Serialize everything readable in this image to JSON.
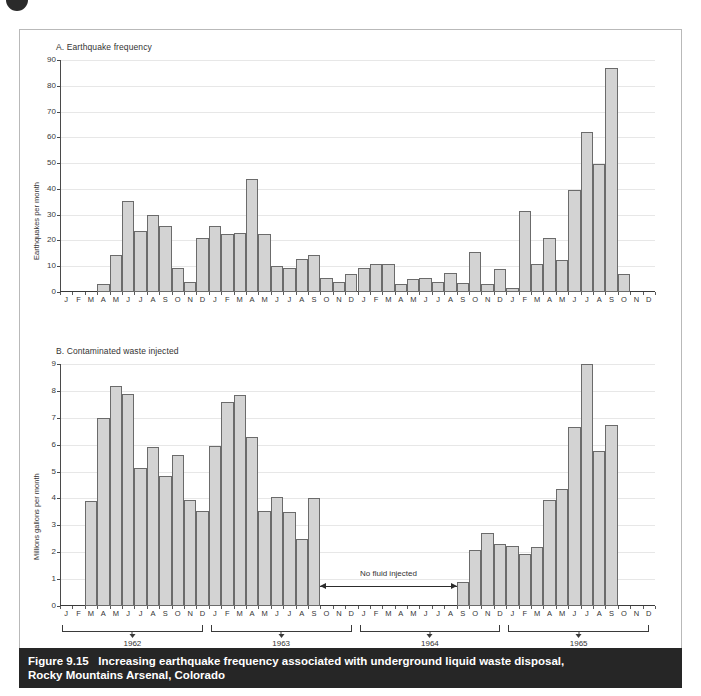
{
  "figure": {
    "caption_number": "Figure 9.15",
    "caption_line1": "Increasing earthquake frequency associated with underground liquid waste disposal,",
    "caption_line2": "Rocky Mountains Arsenal, Colorado",
    "accent_bar_color": "#262626",
    "bar_fill_color": "#d3d3d3",
    "bar_stroke_color": "#6b6b6b",
    "gridline_color": "#e7e7e7"
  },
  "months": [
    "J",
    "F",
    "M",
    "A",
    "M",
    "J",
    "J",
    "A",
    "S",
    "O",
    "N",
    "D"
  ],
  "years": [
    "1962",
    "1963",
    "1964",
    "1965"
  ],
  "annotation": {
    "no_fluid": "No fluid injected"
  },
  "chart_data": [
    {
      "type": "bar",
      "id": "A",
      "title": "A. Earthquake frequency",
      "ylabel": "Earthquakes per month",
      "xlabel": "",
      "ylim": [
        0,
        90
      ],
      "yticks": [
        0,
        10,
        20,
        30,
        40,
        50,
        60,
        70,
        80,
        90
      ],
      "grid": true,
      "legend": "none",
      "categories": [
        "1962-J",
        "1962-F",
        "1962-M",
        "1962-A",
        "1962-M",
        "1962-J",
        "1962-J",
        "1962-A",
        "1962-S",
        "1962-O",
        "1962-N",
        "1962-D",
        "1963-J",
        "1963-F",
        "1963-M",
        "1963-A",
        "1963-M",
        "1963-J",
        "1963-J",
        "1963-A",
        "1963-S",
        "1963-O",
        "1963-N",
        "1963-D",
        "1964-J",
        "1964-F",
        "1964-M",
        "1964-A",
        "1964-M",
        "1964-J",
        "1964-J",
        "1964-A",
        "1964-S",
        "1964-O",
        "1964-N",
        "1964-D",
        "1965-J",
        "1965-F",
        "1965-M",
        "1965-A",
        "1965-M",
        "1965-J",
        "1965-J",
        "1965-A",
        "1965-S",
        "1965-O",
        "1965-N",
        "1965-D"
      ],
      "values": [
        0,
        0,
        0,
        3,
        14.5,
        35.5,
        23.5,
        30,
        25.5,
        9.5,
        4,
        21,
        25.5,
        22.5,
        23,
        44,
        22.5,
        10,
        9.5,
        13,
        14.5,
        5.5,
        4,
        7,
        9.5,
        11,
        11,
        3,
        5,
        5.5,
        4,
        7.5,
        3.5,
        15.5,
        3,
        9,
        1.5,
        31.5,
        11,
        21,
        12.5,
        39.5,
        62,
        49.5,
        87,
        7,
        0,
        0
      ]
    },
    {
      "type": "bar",
      "id": "B",
      "title": "B. Contaminated waste injected",
      "ylabel": "Millions gallons per month",
      "xlabel": "",
      "ylim": [
        0,
        9
      ],
      "yticks": [
        0,
        1,
        2,
        3,
        4,
        5,
        6,
        7,
        8,
        9
      ],
      "grid": true,
      "legend": "none",
      "categories": [
        "1962-J",
        "1962-F",
        "1962-M",
        "1962-A",
        "1962-M",
        "1962-J",
        "1962-J",
        "1962-A",
        "1962-S",
        "1962-O",
        "1962-N",
        "1962-D",
        "1963-J",
        "1963-F",
        "1963-M",
        "1963-A",
        "1963-M",
        "1963-J",
        "1963-J",
        "1963-A",
        "1963-S",
        "1963-O",
        "1963-N",
        "1963-D",
        "1964-J",
        "1964-F",
        "1964-M",
        "1964-A",
        "1964-M",
        "1964-J",
        "1964-J",
        "1964-A",
        "1964-S",
        "1964-O",
        "1964-N",
        "1964-D",
        "1965-J",
        "1965-F",
        "1965-M",
        "1965-A",
        "1965-M",
        "1965-J",
        "1965-J",
        "1965-A",
        "1965-S",
        "1965-O",
        "1965-N",
        "1965-D"
      ],
      "values": [
        0,
        0,
        3.9,
        7.0,
        8.2,
        7.9,
        5.15,
        5.9,
        4.85,
        5.6,
        3.95,
        3.55,
        5.95,
        7.6,
        7.85,
        6.3,
        3.55,
        4.05,
        3.5,
        2.5,
        4.0,
        0,
        0,
        0,
        0,
        0,
        0,
        0,
        0,
        0,
        0,
        0,
        0.9,
        2.1,
        2.7,
        2.3,
        2.25,
        1.95,
        2.2,
        3.95,
        4.35,
        6.65,
        9.0,
        5.75,
        6.75,
        0,
        0,
        0
      ]
    }
  ]
}
